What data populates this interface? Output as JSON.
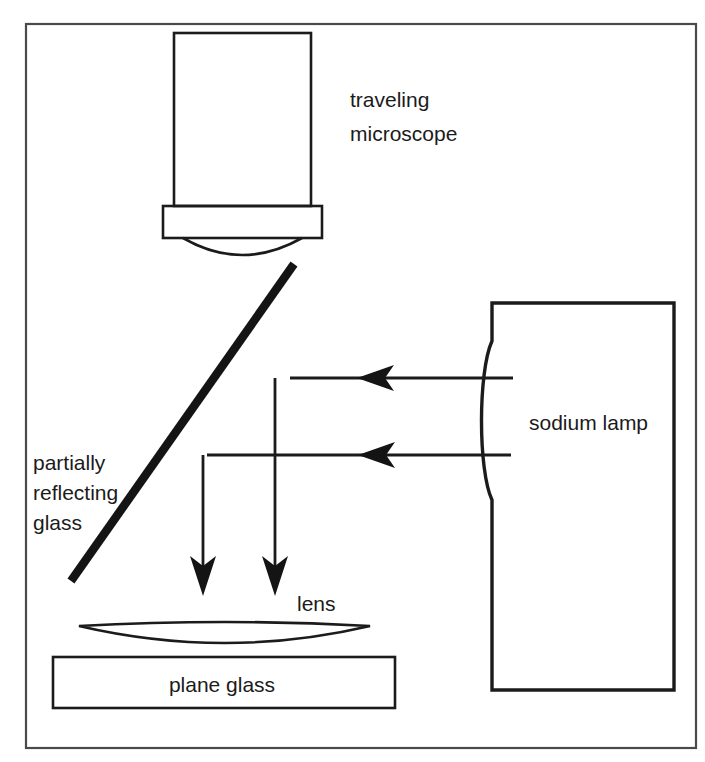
{
  "figure": {
    "kind": "optics-apparatus-diagram",
    "title_text": "",
    "labels": {
      "traveling_microscope_line1": "traveling",
      "traveling_microscope_line2": "microscope",
      "partially_reflecting_glass_line1": "partially",
      "partially_reflecting_glass_line2": "reflecting",
      "partially_reflecting_glass_line3": "glass",
      "sodium_lamp": "sodium lamp",
      "lens": "lens",
      "plane_glass": "plane glass"
    },
    "colors": {
      "ink": "#1b1b1b",
      "diagonal_glass": "#141414",
      "frame": "#4a4a4a",
      "background": "#ffffff"
    },
    "components": [
      {
        "name": "traveling-microscope",
        "label": "traveling microscope",
        "parts": [
          "body-tube",
          "objective-mount",
          "objective-lens-arc"
        ]
      },
      {
        "name": "partially-reflecting-glass",
        "label": "partially reflecting glass",
        "orientation": "45-degree-diagonal"
      },
      {
        "name": "sodium-lamp",
        "label": "sodium lamp",
        "parts": [
          "housing-rectangle",
          "concave-aperture-arc"
        ]
      },
      {
        "name": "lens",
        "label": "lens",
        "shape": "thin-convex"
      },
      {
        "name": "plane-glass",
        "label": "plane glass",
        "shape": "rectangle"
      }
    ],
    "rays": [
      {
        "name": "upper-incident-ray",
        "direction": "leftward",
        "from_x": 512,
        "to_x": 282,
        "y": 378
      },
      {
        "name": "lower-incident-ray",
        "direction": "leftward",
        "from_x": 510,
        "to_x": 210,
        "y": 455
      },
      {
        "name": "upper-reflected-ray",
        "direction": "downward",
        "x": 275,
        "from_y": 380,
        "to_y": 592
      },
      {
        "name": "lower-reflected-ray",
        "direction": "downward",
        "x": 203,
        "from_y": 457,
        "to_y": 592
      }
    ]
  }
}
